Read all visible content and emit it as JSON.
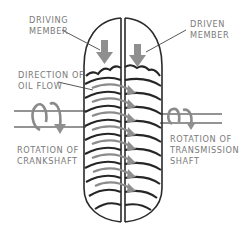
{
  "diagram": {
    "type": "fluid-coupling-cross-section",
    "labels": {
      "driving_member": [
        "DRIVING",
        "MEMBER"
      ],
      "driven_member": [
        "DRIVEN",
        "MEMBER"
      ],
      "direction_of_oil_flow": [
        "DIRECTION OF",
        "OIL FLOW"
      ],
      "rotation_of_crankshaft": [
        "ROTATION OF",
        "CRANKSHAFT"
      ],
      "rotation_of_transmission_shaft": [
        "ROTATION OF",
        "TRANSMISSION",
        "SHAFT"
      ]
    },
    "colors": {
      "outline": "#2a2a2a",
      "arrow_grey": "#8f8f8f",
      "label_grey": "#7a7a7a",
      "background": "#ffffff"
    }
  }
}
